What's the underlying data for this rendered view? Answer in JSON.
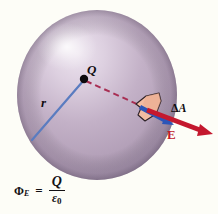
{
  "figure": {
    "background_color": "#fdfdf7"
  },
  "sphere": {
    "name": "gaussian-surface-sphere",
    "center_x": 97,
    "center_y": 95,
    "radius_x": 80,
    "radius_y": 85,
    "fill_color": "#b9a7bd",
    "highlight_color": "#ece2ee",
    "shadow_color": "#9b88a3"
  },
  "charge": {
    "label": "Q",
    "dot_color": "#0c0a0c",
    "x": 83,
    "y": 79
  },
  "radius": {
    "label": "r",
    "line_color": "#5577bb",
    "from_x": 83,
    "from_y": 79,
    "to_x": 32,
    "to_y": 140
  },
  "dashed_ray": {
    "name": "radial-dashed-line",
    "color": "#a32b50",
    "from_x": 86,
    "from_y": 80,
    "to_x": 147,
    "to_y": 108
  },
  "patch": {
    "label_delta": "Δ",
    "label_a": "A",
    "fill_color": "#f3bda4",
    "stroke_color": "#2b2026"
  },
  "normal_arrow": {
    "name": "area-normal-vector",
    "color": "#2a52b4",
    "from_x": 139,
    "from_y": 106,
    "to_x": 173,
    "to_y": 124
  },
  "field_arrow": {
    "label": "E",
    "color": "#c4182e",
    "from_x": 146,
    "from_y": 110,
    "to_x": 211,
    "to_y": 134
  },
  "formula": {
    "symbol": "Φ",
    "symbol_subscript": "E",
    "equals": "=",
    "numerator": "Q",
    "denominator_symbol": "ε",
    "denominator_subscript": "0",
    "full_text": "ΦE = Q / ε0"
  }
}
